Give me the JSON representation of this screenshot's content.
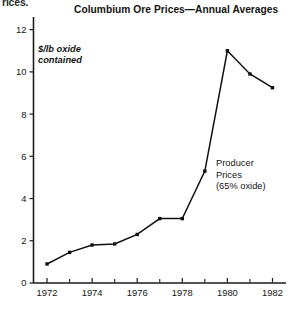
{
  "page": {
    "clipped_text_top": "rices.",
    "background": "#ffffff",
    "ink": "#101010"
  },
  "chart_data": {
    "type": "line",
    "title": "Columbium Ore Prices—Annual Averages",
    "xlabel": "",
    "ylabel": "$/lb oxide contained",
    "ylabel_lines": [
      "$/lb oxide",
      "contained"
    ],
    "series_annotation_lines": [
      "Producer",
      "Prices",
      "(65% oxide)"
    ],
    "series": [
      {
        "name": "Producer Prices (65% oxide)",
        "x": [
          1972,
          1973,
          1974,
          1975,
          1976,
          1977,
          1978,
          1979,
          1980,
          1981,
          1982
        ],
        "values": [
          0.9,
          1.45,
          1.8,
          1.85,
          2.3,
          3.05,
          3.05,
          5.3,
          11.0,
          9.9,
          9.25
        ],
        "color": "#101010",
        "marker": "square"
      }
    ],
    "x": [
      1972,
      1973,
      1974,
      1975,
      1976,
      1977,
      1978,
      1979,
      1980,
      1981,
      1982
    ],
    "xlim": [
      1971.4,
      1982.6
    ],
    "ylim": [
      0,
      12.6
    ],
    "xticks": [
      1972,
      1973,
      1974,
      1975,
      1976,
      1977,
      1978,
      1979,
      1980,
      1981,
      1982
    ],
    "xticklabels": [
      "1972",
      "",
      "1974",
      "",
      "1976",
      "",
      "1978",
      "",
      "1980",
      "",
      "1982"
    ],
    "xticklabels_major": [
      "1972",
      "1974",
      "1976",
      "1978",
      "1980",
      "1982"
    ],
    "yticks": [
      0,
      2,
      4,
      6,
      8,
      10,
      12
    ],
    "yticklabels": [
      "0",
      "2",
      "4",
      "6",
      "8",
      "10",
      "12"
    ],
    "grid": false,
    "legend": "none"
  }
}
